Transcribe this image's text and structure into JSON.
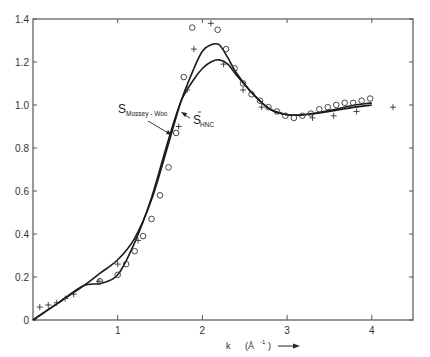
{
  "chart_data": {
    "type": "line",
    "title": "",
    "xlabel": "k (Å⁻¹)",
    "ylabel": "",
    "xlim": [
      0,
      4.45
    ],
    "ylim": [
      0,
      1.4
    ],
    "grid": false,
    "x_ticks": [
      "1",
      "2",
      "3",
      "4"
    ],
    "y_ticks": [
      "0",
      "0.2",
      "0.4",
      "0.6",
      "0.8",
      "1.0",
      "1.2",
      "1.4"
    ],
    "annotations": [
      {
        "text": "S",
        "subscript": "Mossey - Woo",
        "points_to": "curve A (higher peak)"
      },
      {
        "text": "S",
        "subscript": "HNC",
        "points_to": "curve B (lower peak)"
      }
    ],
    "series": [
      {
        "name": "S Mossey-Woo",
        "kind": "line",
        "x": [
          0,
          0.3,
          0.6,
          0.8,
          1.0,
          1.2,
          1.4,
          1.6,
          1.75,
          1.9,
          2.0,
          2.1,
          2.2,
          2.3,
          2.4,
          2.6,
          2.8,
          3.0,
          3.2,
          3.5,
          3.8,
          4.0
        ],
        "y": [
          0,
          0.08,
          0.16,
          0.22,
          0.28,
          0.38,
          0.56,
          0.82,
          1.02,
          1.17,
          1.25,
          1.28,
          1.28,
          1.22,
          1.15,
          1.05,
          0.98,
          0.955,
          0.955,
          0.97,
          0.99,
          1.0
        ]
      },
      {
        "name": "S HNC",
        "kind": "line",
        "x": [
          0,
          0.3,
          0.6,
          0.8,
          1.0,
          1.2,
          1.4,
          1.6,
          1.75,
          1.9,
          2.0,
          2.1,
          2.2,
          2.3,
          2.4,
          2.6,
          2.8,
          3.0,
          3.2,
          3.5,
          3.8,
          4.0
        ],
        "y": [
          0,
          0.08,
          0.16,
          0.17,
          0.21,
          0.36,
          0.57,
          0.84,
          1.02,
          1.12,
          1.17,
          1.2,
          1.21,
          1.19,
          1.14,
          1.05,
          0.98,
          0.955,
          0.955,
          0.975,
          1.0,
          1.01
        ]
      },
      {
        "name": "circles",
        "kind": "scatter",
        "marker": "o",
        "x": [
          0.79,
          1.0,
          1.1,
          1.2,
          1.3,
          1.4,
          1.5,
          1.6,
          1.69,
          1.78,
          1.88,
          2.18,
          2.28,
          2.38,
          2.48,
          2.58,
          2.68,
          2.78,
          2.88,
          2.98,
          3.08,
          3.18,
          3.28,
          3.38,
          3.48,
          3.58,
          3.68,
          3.78,
          3.88,
          3.98
        ],
        "y": [
          0.18,
          0.21,
          0.26,
          0.32,
          0.39,
          0.47,
          0.58,
          0.71,
          0.87,
          1.13,
          1.36,
          1.35,
          1.26,
          1.17,
          1.1,
          1.05,
          1.02,
          0.99,
          0.97,
          0.95,
          0.94,
          0.95,
          0.96,
          0.98,
          0.99,
          1.0,
          1.01,
          1.01,
          1.02,
          1.03
        ]
      },
      {
        "name": "crosses",
        "kind": "scatter",
        "marker": "+",
        "x": [
          0.08,
          0.18,
          0.28,
          0.38,
          0.48,
          0.78,
          1.0,
          1.24,
          1.72,
          1.82,
          1.9,
          2.1,
          2.25,
          2.48,
          2.7,
          3.3,
          3.55,
          3.82,
          4.25
        ],
        "y": [
          0.06,
          0.07,
          0.08,
          0.1,
          0.12,
          0.18,
          0.26,
          0.37,
          0.9,
          1.07,
          1.26,
          1.38,
          1.19,
          1.07,
          0.99,
          0.94,
          0.95,
          0.97,
          0.99
        ]
      }
    ]
  },
  "labels": {
    "x_axis_label_k": "k",
    "x_axis_label_unit": "(Å",
    "x_axis_label_exp": "-1",
    "x_axis_label_close": ")",
    "anno_mw_main": "S",
    "anno_mw_sub": "Mossey - Woo",
    "anno_hnc_main": "S",
    "anno_hnc_sub": "HNC"
  }
}
